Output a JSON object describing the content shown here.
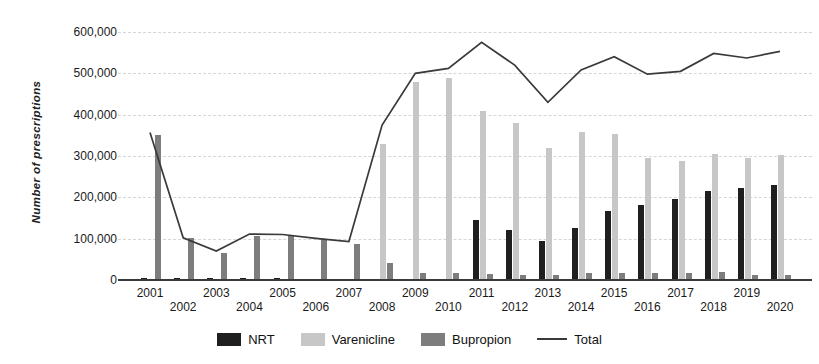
{
  "figure": {
    "ylabel": "Number of prescriptions",
    "background": "#ffffff",
    "gridline_color": "#d6d6d6",
    "axis_color": "#3a3a3a"
  },
  "chart_data": {
    "type": "bar",
    "subtype": "grouped bars with total line overlay",
    "title": "",
    "xlabel": "",
    "ylabel": "Number of prescriptions",
    "ylim": [
      0,
      600000
    ],
    "yticks": [
      "0",
      "100,000",
      "200,000",
      "300,000",
      "400,000",
      "500,000",
      "600,000"
    ],
    "ytick_values": [
      0,
      100000,
      200000,
      300000,
      400000,
      500000,
      600000
    ],
    "grid": true,
    "legend_position": "bottom",
    "categories": [
      2001,
      2002,
      2003,
      2004,
      2005,
      2006,
      2007,
      2008,
      2009,
      2010,
      2011,
      2012,
      2013,
      2014,
      2015,
      2016,
      2017,
      2018,
      2019,
      2020
    ],
    "series": [
      {
        "name": "NRT",
        "render": "bar",
        "color": "#1f1f1f",
        "values": [
          5000,
          4000,
          4000,
          4000,
          4000,
          3000,
          3000,
          3000,
          2000,
          3000,
          146000,
          121000,
          95000,
          125000,
          166000,
          181000,
          196000,
          215000,
          223000,
          231000
        ]
      },
      {
        "name": "Varenicline",
        "render": "bar",
        "color": "#c7c7c7",
        "values": [
          0,
          0,
          0,
          0,
          0,
          0,
          0,
          328000,
          480000,
          488000,
          410000,
          380000,
          319000,
          359000,
          354000,
          295000,
          289000,
          304000,
          295000,
          302000
        ]
      },
      {
        "name": "Bupropion",
        "render": "bar",
        "color": "#7d7d7d",
        "values": [
          352000,
          101000,
          66000,
          107000,
          106000,
          100000,
          87000,
          40000,
          18000,
          18000,
          15000,
          13000,
          12000,
          17000,
          17000,
          17000,
          17000,
          20000,
          12000,
          13000
        ]
      },
      {
        "name": "Total",
        "render": "line",
        "color": "#3a3a3a",
        "values": [
          357000,
          102000,
          70000,
          111000,
          110000,
          101000,
          93000,
          375000,
          500000,
          512000,
          575000,
          520000,
          430000,
          508000,
          540000,
          498000,
          505000,
          548000,
          537000,
          553000
        ]
      }
    ]
  }
}
